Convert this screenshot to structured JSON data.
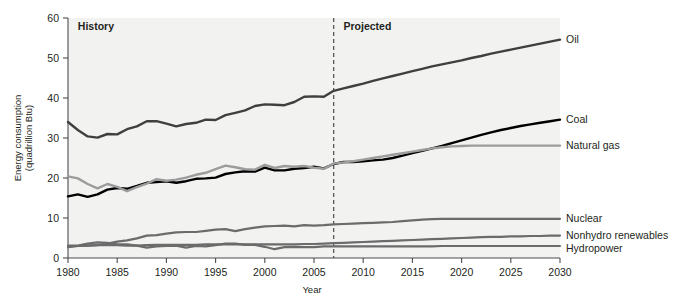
{
  "chart_data": {
    "type": "line",
    "title": "",
    "subtitle": "",
    "xlabel": "Year",
    "ylabel": "Energy consumption\n(quadrillion Btu)",
    "ylabel_line1": "Energy consumption",
    "ylabel_line2": "(quadrillion Btu)",
    "xlim": [
      1980,
      2030
    ],
    "ylim": [
      0,
      60
    ],
    "xticks": [
      1980,
      1985,
      1990,
      1995,
      2000,
      2005,
      2010,
      2015,
      2020,
      2025,
      2030
    ],
    "xticklabels": [
      "1980",
      "1985",
      "1990",
      "1995",
      "2000",
      "2005",
      "2010",
      "2015",
      "2020",
      "2025",
      "2030"
    ],
    "yticks": [
      0,
      10,
      20,
      30,
      40,
      50,
      60
    ],
    "yticklabels": [
      "0",
      "10",
      "20",
      "30",
      "40",
      "50",
      "60"
    ],
    "grid": false,
    "legend_position": "right-inline-end-of-line",
    "annotations": [
      {
        "name": "history-label",
        "text": "History",
        "x": 1981,
        "y": 57,
        "bold": true
      },
      {
        "name": "projected-label",
        "text": "Projected",
        "x": 2008,
        "y": 57,
        "bold": true
      },
      {
        "name": "forecast-divider",
        "text": "",
        "x": 2007,
        "type": "vertical-dashed-line"
      }
    ],
    "x": [
      1980,
      1981,
      1982,
      1983,
      1984,
      1985,
      1986,
      1987,
      1988,
      1989,
      1990,
      1991,
      1992,
      1993,
      1994,
      1995,
      1996,
      1997,
      1998,
      1999,
      2000,
      2001,
      2002,
      2003,
      2004,
      2005,
      2006,
      2007,
      2008,
      2009,
      2010,
      2011,
      2012,
      2013,
      2014,
      2015,
      2016,
      2017,
      2018,
      2019,
      2020,
      2021,
      2022,
      2023,
      2024,
      2025,
      2026,
      2027,
      2028,
      2029,
      2030
    ],
    "series": [
      {
        "name": "Oil",
        "label": "Oil",
        "color": "#3f3f3f",
        "width": 2.4,
        "values": [
          34.0,
          32.0,
          30.4,
          30.1,
          31.0,
          30.9,
          32.2,
          32.9,
          34.2,
          34.2,
          33.6,
          32.9,
          33.5,
          33.8,
          34.6,
          34.5,
          35.7,
          36.3,
          36.9,
          38.0,
          38.4,
          38.3,
          38.2,
          39.0,
          40.3,
          40.4,
          40.3,
          41.8,
          42.4,
          43.0,
          43.6,
          44.3,
          44.9,
          45.5,
          46.1,
          46.7,
          47.3,
          47.9,
          48.4,
          48.9,
          49.4,
          50.0,
          50.5,
          51.1,
          51.6,
          52.1,
          52.6,
          53.1,
          53.6,
          54.1,
          54.6
        ]
      },
      {
        "name": "Coal",
        "label": "Coal",
        "color": "#000000",
        "width": 2.4,
        "values": [
          15.4,
          15.9,
          15.3,
          15.9,
          17.1,
          17.5,
          17.3,
          18.0,
          18.8,
          19.0,
          19.2,
          18.8,
          19.2,
          19.8,
          19.9,
          20.1,
          21.0,
          21.4,
          21.7,
          21.6,
          22.6,
          21.9,
          21.9,
          22.3,
          22.5,
          22.8,
          22.4,
          23.5,
          24.0,
          24.0,
          24.2,
          24.4,
          24.6,
          25.0,
          25.6,
          26.2,
          26.8,
          27.4,
          28.0,
          28.7,
          29.4,
          30.1,
          30.8,
          31.4,
          32.0,
          32.5,
          33.0,
          33.4,
          33.8,
          34.2,
          34.6
        ]
      },
      {
        "name": "Natural gas",
        "label": "Natural gas",
        "color": "#9c9c9c",
        "width": 2.4,
        "values": [
          20.4,
          19.9,
          18.5,
          17.4,
          18.5,
          17.8,
          16.7,
          17.7,
          18.6,
          19.7,
          19.3,
          19.6,
          20.1,
          20.8,
          21.3,
          22.2,
          23.1,
          22.7,
          22.2,
          22.1,
          23.3,
          22.5,
          23.0,
          22.8,
          23.0,
          22.6,
          22.3,
          23.6,
          23.9,
          24.2,
          24.6,
          25.0,
          25.4,
          25.8,
          26.2,
          26.6,
          27.0,
          27.4,
          27.7,
          27.9,
          28.0,
          28.1,
          28.1,
          28.1,
          28.1,
          28.1,
          28.1,
          28.1,
          28.1,
          28.1,
          28.1
        ]
      },
      {
        "name": "Nuclear",
        "label": "Nuclear",
        "color": "#6b6b6b",
        "width": 2.2,
        "values": [
          2.7,
          3.0,
          3.1,
          3.2,
          3.6,
          4.1,
          4.4,
          4.9,
          5.6,
          5.7,
          6.1,
          6.4,
          6.5,
          6.5,
          6.8,
          7.1,
          7.2,
          6.7,
          7.2,
          7.6,
          7.9,
          8.0,
          8.1,
          7.9,
          8.2,
          8.1,
          8.2,
          8.4,
          8.5,
          8.6,
          8.7,
          8.8,
          8.9,
          9.0,
          9.2,
          9.4,
          9.6,
          9.7,
          9.8,
          9.8,
          9.8,
          9.8,
          9.8,
          9.8,
          9.8,
          9.8,
          9.8,
          9.8,
          9.8,
          9.8,
          9.8
        ]
      },
      {
        "name": "Nonhydro renewables",
        "label": "Nonhydro renewables",
        "color": "#6b6b6b",
        "width": 2.2,
        "values": [
          2.9,
          3.0,
          3.1,
          3.2,
          3.2,
          3.2,
          3.1,
          3.1,
          3.2,
          3.3,
          3.3,
          3.3,
          3.3,
          3.3,
          3.4,
          3.4,
          3.4,
          3.4,
          3.4,
          3.4,
          3.4,
          3.4,
          3.4,
          3.4,
          3.5,
          3.5,
          3.6,
          3.7,
          3.8,
          3.9,
          4.0,
          4.1,
          4.2,
          4.3,
          4.4,
          4.5,
          4.6,
          4.7,
          4.8,
          4.9,
          5.0,
          5.1,
          5.2,
          5.3,
          5.3,
          5.4,
          5.4,
          5.5,
          5.5,
          5.6,
          5.6
        ]
      },
      {
        "name": "Hydropower",
        "label": "Hydropower",
        "color": "#6b6b6b",
        "width": 2.2,
        "values": [
          3.1,
          3.1,
          3.6,
          3.9,
          3.8,
          3.4,
          3.4,
          3.1,
          2.6,
          2.9,
          3.0,
          3.1,
          2.6,
          3.0,
          2.9,
          3.2,
          3.6,
          3.6,
          3.3,
          3.3,
          2.8,
          2.2,
          2.7,
          2.8,
          2.7,
          2.7,
          2.9,
          2.9,
          2.9,
          2.9,
          2.9,
          2.9,
          2.9,
          2.9,
          2.9,
          2.9,
          2.9,
          2.9,
          3.0,
          3.0,
          3.0,
          3.0,
          3.0,
          3.0,
          3.0,
          3.0,
          3.0,
          3.0,
          3.0,
          3.0,
          3.0
        ]
      }
    ]
  },
  "colors": {
    "plot_background": "#f2f2f1",
    "page_background": "#ffffff",
    "axis": "#4d4d4d",
    "text": "#231f20"
  }
}
